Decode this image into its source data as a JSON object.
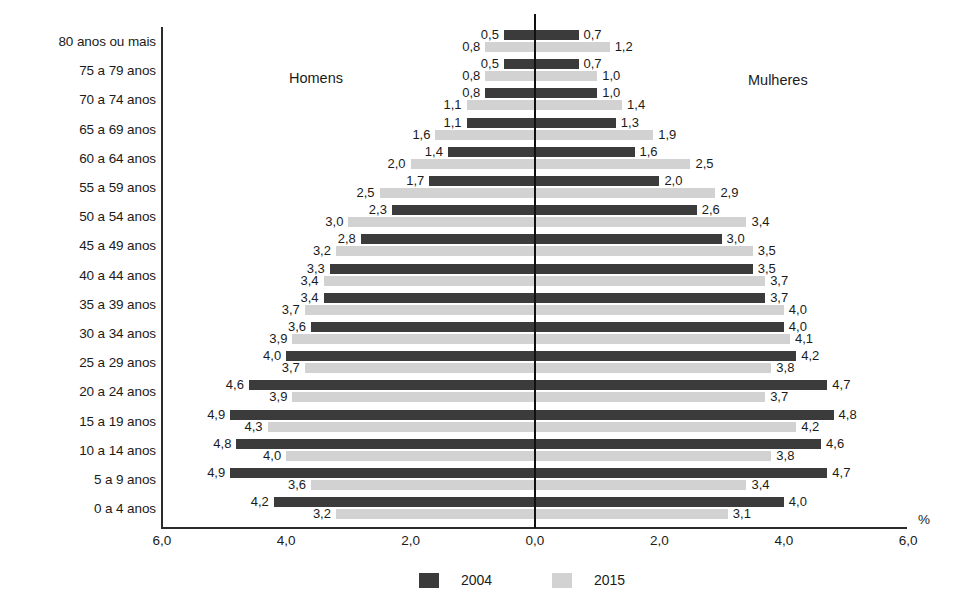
{
  "chart_data": {
    "type": "bar",
    "subtype": "population-pyramid",
    "title": "",
    "xlabel": "%",
    "ylabel": "",
    "left_group_label": "Homens",
    "right_group_label": "Mulheres",
    "xlim": [
      -6.0,
      6.0
    ],
    "xticks": [
      "6,0",
      "4,0",
      "2,0",
      "0,0",
      "2,0",
      "4,0",
      "6,0"
    ],
    "xtick_values": [
      -6.0,
      -4.0,
      -2.0,
      0.0,
      2.0,
      4.0,
      6.0
    ],
    "grid": false,
    "legend_position": "bottom-center",
    "legend": [
      {
        "name": "2004",
        "color": "#3b3b3b"
      },
      {
        "name": "2015",
        "color": "#d2d2d2"
      }
    ],
    "categories": [
      "80 anos ou mais",
      "75 a 79 anos",
      "70 a 74 anos",
      "65 a 69 anos",
      "60 a 64 anos",
      "55 a 59 anos",
      "50 a 54 anos",
      "45 a 49 anos",
      "40 a 44 anos",
      "35 a 39 anos",
      "30 a 34 anos",
      "25 a 29 anos",
      "20 a 24 anos",
      "15 a 19 anos",
      "10 a 14 anos",
      "5 a 9 anos",
      "0 a 4 anos"
    ],
    "series": [
      {
        "name": "2004",
        "side": "left",
        "values": [
          0.5,
          0.5,
          0.8,
          1.1,
          1.4,
          1.7,
          2.3,
          2.8,
          3.3,
          3.4,
          3.6,
          4.0,
          4.6,
          4.9,
          4.8,
          4.9,
          4.2
        ],
        "labels": [
          "0,5",
          "0,5",
          "0,8",
          "1,1",
          "1,4",
          "1,7",
          "2,3",
          "2,8",
          "3,3",
          "3,4",
          "3,6",
          "4,0",
          "4,6",
          "4,9",
          "4,8",
          "4,9",
          "4,2"
        ]
      },
      {
        "name": "2015",
        "side": "left",
        "values": [
          0.8,
          0.8,
          1.1,
          1.6,
          2.0,
          2.5,
          3.0,
          3.2,
          3.4,
          3.7,
          3.9,
          3.7,
          3.9,
          4.3,
          4.0,
          3.6,
          3.2
        ],
        "labels": [
          "0,8",
          "0,8",
          "1,1",
          "1,6",
          "2,0",
          "2,5",
          "3,0",
          "3,2",
          "3,4",
          "3,7",
          "3,9",
          "3,7",
          "3,9",
          "4,3",
          "4,0",
          "3,6",
          "3,2"
        ]
      },
      {
        "name": "2004",
        "side": "right",
        "values": [
          0.7,
          0.7,
          1.0,
          1.3,
          1.6,
          2.0,
          2.6,
          3.0,
          3.5,
          3.7,
          4.0,
          4.2,
          4.7,
          4.8,
          4.6,
          4.7,
          4.0
        ],
        "labels": [
          "0,7",
          "0,7",
          "1,0",
          "1,3",
          "1,6",
          "2,0",
          "2,6",
          "3,0",
          "3,5",
          "3,7",
          "4,0",
          "4,2",
          "4,7",
          "4,8",
          "4,6",
          "4,7",
          "4,0"
        ]
      },
      {
        "name": "2015",
        "side": "right",
        "values": [
          1.2,
          1.0,
          1.4,
          1.9,
          2.5,
          2.9,
          3.4,
          3.5,
          3.7,
          4.0,
          4.1,
          3.8,
          3.7,
          4.2,
          3.8,
          3.4,
          3.1
        ],
        "labels": [
          "1,2",
          "1,0",
          "1,4",
          "1,9",
          "2,5",
          "2,9",
          "3,4",
          "3,5",
          "3,7",
          "4,0",
          "4,1",
          "3,8",
          "3,7",
          "4,2",
          "3,8",
          "3,4",
          "3,1"
        ]
      }
    ]
  },
  "colors": {
    "series_2004": "#3b3b3b",
    "series_2015": "#d2d2d2",
    "axis": "#2b2b2b",
    "text": "#1b1b1b"
  }
}
